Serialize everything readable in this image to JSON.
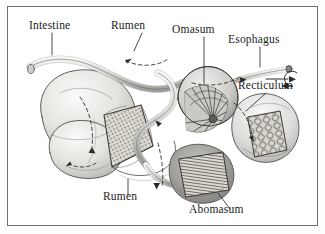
{
  "figure": {
    "style": "pencil-engraving illustration",
    "frame_color": "#6f6f72",
    "background_color": "#ffffff",
    "page_color": "#fdfdfb",
    "label_color": "#1b1b1f",
    "leader_color": "#2a2a2e"
  },
  "labels": [
    {
      "id": "intestine",
      "text": "Intestine"
    },
    {
      "id": "rumen_top",
      "text": "Rumen"
    },
    {
      "id": "omasum",
      "text": "Omasum"
    },
    {
      "id": "esophagus",
      "text": "Esophagus"
    },
    {
      "id": "recticulum",
      "text": "Recticulum"
    },
    {
      "id": "rumen_bottom",
      "text": "Rumen"
    },
    {
      "id": "abomasum",
      "text": "Abomasum"
    }
  ]
}
